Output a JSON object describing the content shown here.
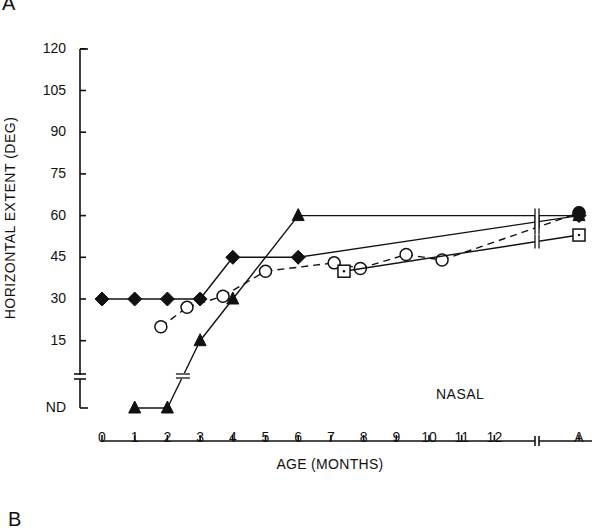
{
  "panel_labels": {
    "top": "A",
    "bottom": "B"
  },
  "chart_data": {
    "type": "line",
    "title": "",
    "xlabel": "AGE (MONTHS)",
    "ylabel": "HORIZONTAL EXTENT (DEG)",
    "annotation": "NASAL",
    "y_ticks": [
      "120",
      "105",
      "90",
      "75",
      "60",
      "45",
      "30",
      "15",
      "ND"
    ],
    "y_tick_values": [
      120,
      105,
      90,
      75,
      60,
      45,
      30,
      15,
      null
    ],
    "x_ticks": [
      "0",
      "1",
      "2",
      "3",
      "4",
      "5",
      "6",
      "7",
      "8",
      "9",
      "10",
      "11",
      "12",
      "A"
    ],
    "ylim": [
      0,
      120
    ],
    "xlim": [
      0,
      12
    ],
    "axis_breaks": {
      "y": "between 15 and ND",
      "x": "between 12 and A"
    },
    "grid": false,
    "legend": "none",
    "series": [
      {
        "name": "filled-diamond",
        "marker": "diamond-filled",
        "linestyle": "solid",
        "points": [
          [
            0,
            30
          ],
          [
            1,
            30
          ],
          [
            2,
            30
          ],
          [
            3,
            30
          ],
          [
            4,
            45
          ],
          [
            6,
            45
          ],
          [
            "A",
            60
          ]
        ]
      },
      {
        "name": "filled-triangle",
        "marker": "triangle-filled",
        "linestyle": "solid",
        "points": [
          [
            1,
            "ND"
          ],
          [
            2,
            "ND"
          ],
          [
            3,
            15
          ],
          [
            4,
            30
          ],
          [
            6,
            60
          ],
          [
            "A",
            60
          ]
        ]
      },
      {
        "name": "open-circle",
        "marker": "circle-open",
        "linestyle": "dashed",
        "points": [
          [
            1.8,
            20
          ],
          [
            2.6,
            27
          ],
          [
            3.7,
            31
          ],
          [
            5.0,
            40
          ],
          [
            7.1,
            43
          ],
          [
            7.9,
            41
          ],
          [
            9.3,
            46
          ],
          [
            10.4,
            44
          ],
          [
            "A",
            61
          ]
        ]
      },
      {
        "name": "open-square",
        "marker": "square-open-dot",
        "linestyle": "solid",
        "points": [
          [
            7.4,
            40
          ],
          [
            "A",
            53
          ]
        ]
      }
    ]
  }
}
